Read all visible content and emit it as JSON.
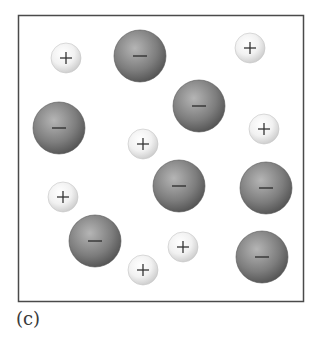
{
  "figure": {
    "caption": "(c)",
    "frame_color": "#4a4a4a",
    "legend_concept": "ionic solid: small cations and large anions",
    "cation": {
      "sign": "+",
      "fill_light": "#ffffff",
      "fill_dark": "#c9c9c9",
      "sign_color": "#333333"
    },
    "anion": {
      "sign": "−",
      "fill_light": "#b5b5b5",
      "fill_dark": "#4d4d4d",
      "sign_color": "#2b2b2b"
    },
    "ions": [
      {
        "type": "cation",
        "sign": "+"
      },
      {
        "type": "anion",
        "sign": "−"
      },
      {
        "type": "cation",
        "sign": "+"
      },
      {
        "type": "anion",
        "sign": "−"
      },
      {
        "type": "anion",
        "sign": "−"
      },
      {
        "type": "cation",
        "sign": "+"
      },
      {
        "type": "cation",
        "sign": "+"
      },
      {
        "type": "anion",
        "sign": "−"
      },
      {
        "type": "cation",
        "sign": "+"
      },
      {
        "type": "anion",
        "sign": "−"
      },
      {
        "type": "anion",
        "sign": "−"
      },
      {
        "type": "cation",
        "sign": "+"
      },
      {
        "type": "anion",
        "sign": "−"
      },
      {
        "type": "cation",
        "sign": "+"
      }
    ]
  }
}
